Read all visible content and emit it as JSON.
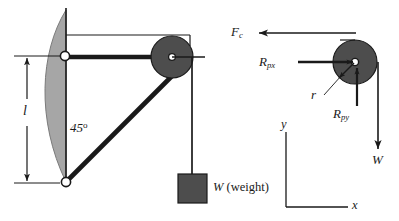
{
  "figure": {
    "background_color": "#ffffff",
    "stroke_color": "#1a1a1a",
    "pulley_fill": "#4d4d4d",
    "leaf_fill": "#a6a6a6",
    "weight_fill": "#4d4d4d",
    "hinge_fill": "#ffffff"
  },
  "left_diagram": {
    "length_label": "l",
    "angle_label": "45",
    "angle_degree_symbol": "o",
    "weight_label": "W",
    "weight_caption": "(weight)"
  },
  "right_diagram": {
    "cable_force_label": "F",
    "cable_force_sub": "c",
    "reaction_x_label": "R",
    "reaction_x_sub": "px",
    "reaction_y_label": "R",
    "reaction_y_sub": "py",
    "radius_label": "r",
    "weight_label": "W"
  },
  "axes": {
    "y_label": "y",
    "x_label": "x"
  },
  "geometry": {
    "left_pulley_center": [
      172,
      57
    ],
    "left_pulley_radius": 21,
    "right_pulley_center": [
      355,
      62
    ],
    "right_pulley_radius": 22,
    "upper_hinge": [
      65,
      56
    ],
    "lower_hinge": [
      66,
      182
    ],
    "weight_block": [
      178,
      174,
      29,
      29
    ]
  }
}
